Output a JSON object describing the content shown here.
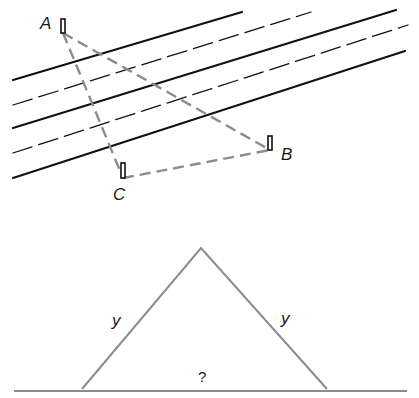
{
  "figure_top": {
    "description": "Stakes A, B, C on either side of a river (parallel lines), connected by dashed sight lines",
    "points": [
      {
        "label": "A",
        "x": 63,
        "y": 33
      },
      {
        "label": "B",
        "x": 270,
        "y": 150
      },
      {
        "label": "C",
        "x": 123,
        "y": 178
      }
    ],
    "river_lines": [
      {
        "style": "solid",
        "x1": 13,
        "y1": 80,
        "x2": 242,
        "y2": 12
      },
      {
        "style": "dashed",
        "x1": 13,
        "y1": 105,
        "x2": 311,
        "y2": 12
      },
      {
        "style": "solid",
        "x1": 13,
        "y1": 128,
        "x2": 396,
        "y2": 10
      },
      {
        "style": "dashed",
        "x1": 13,
        "y1": 153,
        "x2": 408,
        "y2": 25
      },
      {
        "style": "solid",
        "x1": 13,
        "y1": 178,
        "x2": 405,
        "y2": 51
      }
    ],
    "line_color": "#111111",
    "sight_line_color": "#8c8c8c"
  },
  "figure_bottom": {
    "description": "Isosceles triangle resting on a ground line",
    "left_side_label": "y",
    "right_side_label": "y",
    "base_label": "?",
    "apex": {
      "x": 201,
      "y": 248
    },
    "base_left": {
      "x": 82,
      "y": 388
    },
    "base_right": {
      "x": 327,
      "y": 388
    },
    "stroke_color": "#8c8c8c"
  }
}
